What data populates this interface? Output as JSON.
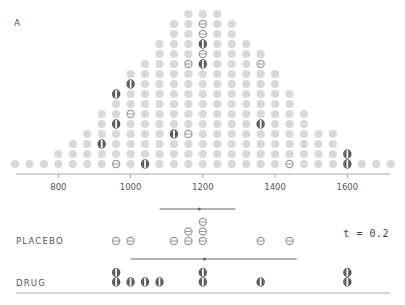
{
  "panel_label": "A",
  "t_label": "t = 0.2",
  "groups": {
    "placebo_label": "PLACEBO",
    "drug_label": "DRUG"
  },
  "colors": {
    "dot_fill": "#d9d9d9",
    "placebo_stroke": "#9a9a9a",
    "drug_fill": "#555555",
    "axis": "#aaaaaa",
    "ci_line": "#666666"
  },
  "chart_data": {
    "type": "scatter",
    "title": "",
    "subtitle": "Sampling distribution of difference in means (dot plot)",
    "xlabel": "",
    "ylabel": "",
    "x_ticks": [
      800,
      1000,
      1200,
      1400,
      1600
    ],
    "xlim": [
      660,
      1740
    ],
    "grid": false,
    "bin_values": [
      680,
      720,
      760,
      800,
      840,
      880,
      920,
      960,
      1000,
      1040,
      1080,
      1120,
      1160,
      1200,
      1240,
      1280,
      1320,
      1360,
      1400,
      1440,
      1480,
      1520,
      1560,
      1600,
      1640,
      1680,
      1720
    ],
    "bin_counts": [
      1,
      1,
      1,
      2,
      3,
      4,
      6,
      8,
      10,
      11,
      13,
      15,
      16,
      16,
      16,
      15,
      13,
      12,
      10,
      8,
      6,
      4,
      4,
      2,
      1,
      1,
      1
    ],
    "highlighted_dots": [
      {
        "bin": 920,
        "level": 3,
        "kind": "drug"
      },
      {
        "bin": 960,
        "level": 1,
        "kind": "placebo"
      },
      {
        "bin": 960,
        "level": 5,
        "kind": "drug"
      },
      {
        "bin": 960,
        "level": 8,
        "kind": "drug"
      },
      {
        "bin": 1000,
        "level": 6,
        "kind": "placebo"
      },
      {
        "bin": 1000,
        "level": 9,
        "kind": "drug"
      },
      {
        "bin": 1040,
        "level": 1,
        "kind": "drug"
      },
      {
        "bin": 1120,
        "level": 4,
        "kind": "drug"
      },
      {
        "bin": 1160,
        "level": 4,
        "kind": "placebo"
      },
      {
        "bin": 1160,
        "level": 11,
        "kind": "placebo"
      },
      {
        "bin": 1200,
        "level": 11,
        "kind": "drug"
      },
      {
        "bin": 1200,
        "level": 13,
        "kind": "drug"
      },
      {
        "bin": 1200,
        "level": 12,
        "kind": "placebo"
      },
      {
        "bin": 1200,
        "level": 14,
        "kind": "placebo"
      },
      {
        "bin": 1200,
        "level": 15,
        "kind": "placebo"
      },
      {
        "bin": 1360,
        "level": 5,
        "kind": "drug"
      },
      {
        "bin": 1360,
        "level": 11,
        "kind": "placebo"
      },
      {
        "bin": 1360,
        "level": 16,
        "kind": "placebo"
      },
      {
        "bin": 1440,
        "level": 1,
        "kind": "placebo"
      },
      {
        "bin": 1600,
        "level": 1,
        "kind": "drug"
      },
      {
        "bin": 1600,
        "level": 2,
        "kind": "drug"
      }
    ],
    "placebo_sample": {
      "values": [
        960,
        1000,
        1120,
        1160,
        1160,
        1200,
        1200,
        1200,
        1360,
        1440
      ],
      "mean": 1190,
      "interval": [
        1080,
        1290
      ]
    },
    "drug_sample": {
      "values": [
        960,
        960,
        1000,
        1040,
        1080,
        1200,
        1200,
        1360,
        1600,
        1600
      ],
      "mean": 1205,
      "interval": [
        1000,
        1460
      ]
    }
  }
}
